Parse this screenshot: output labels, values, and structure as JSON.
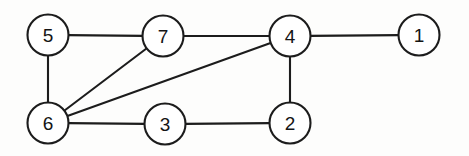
{
  "figure": {
    "background_color": "#fdfdfc",
    "stroke_color": "#1c1c1c",
    "node_fill_color": "#ffffff",
    "label_color": "#141414",
    "node_radius": 20.5,
    "edge_width": 2.1,
    "width": 469,
    "height": 156
  },
  "chart_data": {
    "type": "diagram",
    "graph_type": "undirected",
    "title": "",
    "node_count": 7,
    "edge_count": 9,
    "nodes": [
      {
        "id": "5",
        "label": "5",
        "x": 48,
        "y": 35,
        "r": 20.5
      },
      {
        "id": "7",
        "label": "7",
        "x": 163,
        "y": 36,
        "r": 20.5
      },
      {
        "id": "4",
        "label": "4",
        "x": 290,
        "y": 36,
        "r": 20.5
      },
      {
        "id": "1",
        "label": "1",
        "x": 419,
        "y": 35,
        "r": 20.5
      },
      {
        "id": "6",
        "label": "6",
        "x": 48,
        "y": 123,
        "r": 20.5
      },
      {
        "id": "3",
        "label": "3",
        "x": 165,
        "y": 124,
        "r": 20.5
      },
      {
        "id": "2",
        "label": "2",
        "x": 290,
        "y": 123,
        "r": 20.5
      }
    ],
    "edges": [
      {
        "id": "edge-5-7",
        "source": "5",
        "target": "7"
      },
      {
        "id": "edge-7-4",
        "source": "7",
        "target": "4"
      },
      {
        "id": "edge-4-1",
        "source": "4",
        "target": "1"
      },
      {
        "id": "edge-5-6",
        "source": "5",
        "target": "6"
      },
      {
        "id": "edge-6-7",
        "source": "6",
        "target": "7"
      },
      {
        "id": "edge-6-4",
        "source": "6",
        "target": "4"
      },
      {
        "id": "edge-6-3",
        "source": "6",
        "target": "3"
      },
      {
        "id": "edge-3-2",
        "source": "3",
        "target": "2"
      },
      {
        "id": "edge-2-4",
        "source": "2",
        "target": "4"
      }
    ],
    "adjacency": {
      "1": [
        "4"
      ],
      "2": [
        "3",
        "4"
      ],
      "3": [
        "6",
        "2"
      ],
      "4": [
        "7",
        "1",
        "6",
        "2"
      ],
      "5": [
        "7",
        "6"
      ],
      "6": [
        "5",
        "7",
        "4",
        "3"
      ],
      "7": [
        "5",
        "4",
        "6"
      ]
    },
    "degrees": {
      "1": 1,
      "2": 2,
      "3": 2,
      "4": 4,
      "5": 2,
      "6": 4,
      "7": 3
    }
  }
}
